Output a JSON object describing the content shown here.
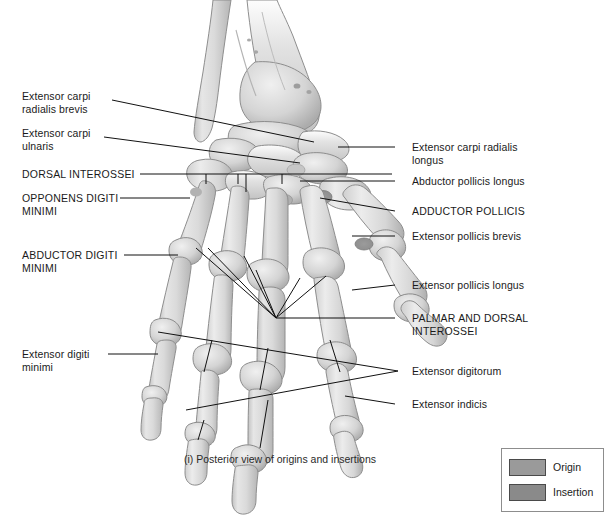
{
  "figure": {
    "caption": "(i) Posterior view of origins and insertions",
    "background_color": "#ffffff",
    "line_color": "#111111",
    "bone_fill": "#dcdcdc",
    "bone_shade": "#b9b9b9",
    "bone_outline": "#8e8e8e"
  },
  "labels_left": [
    {
      "id": "extensor-carpi-radialis-brevis",
      "text": "Extensor carpi\nradialis brevis",
      "style": "title",
      "x": 22,
      "y": 95
    },
    {
      "id": "extensor-carpi-ulnaris",
      "text": "Extensor carpi\nulnaris",
      "style": "title",
      "x": 22,
      "y": 132
    },
    {
      "id": "dorsal-interossei",
      "text": "DORSAL INTEROSSEI",
      "style": "caps",
      "x": 22,
      "y": 169
    },
    {
      "id": "opponens-digiti-minimi",
      "text": "OPPONENS DIGITI\nMINIMI",
      "style": "caps",
      "x": 22,
      "y": 194
    },
    {
      "id": "abductor-digiti-minimi",
      "text": "ABDUCTOR DIGITI\nMINIMI",
      "style": "caps",
      "x": 22,
      "y": 251
    },
    {
      "id": "extensor-digiti-minimi",
      "text": "Extensor digiti\nminimi",
      "style": "title",
      "x": 22,
      "y": 349
    }
  ],
  "labels_right": [
    {
      "id": "extensor-carpi-radialis-longus",
      "text": "Extensor carpi radialis\nlongus",
      "style": "title",
      "x": 412,
      "y": 142
    },
    {
      "id": "abductor-pollicis-longus",
      "text": "Abductor pollicis longus",
      "style": "title",
      "x": 412,
      "y": 177
    },
    {
      "id": "adductor-pollicis",
      "text": "ADDUCTOR POLLICIS",
      "style": "caps",
      "x": 412,
      "y": 206
    },
    {
      "id": "extensor-pollicis-brevis",
      "text": "Extensor pollicis brevis",
      "style": "title",
      "x": 412,
      "y": 231
    },
    {
      "id": "extensor-pollicis-longus",
      "text": "Extensor pollicis longus",
      "style": "title",
      "x": 412,
      "y": 280
    },
    {
      "id": "palmar-and-dorsal-interossei",
      "text": "PALMAR AND DORSAL\nINTEROSSEI",
      "style": "caps",
      "x": 412,
      "y": 313
    },
    {
      "id": "extensor-digitorum",
      "text": "Extensor digitorum",
      "style": "title",
      "x": 412,
      "y": 366
    },
    {
      "id": "extensor-indicis",
      "text": "Extensor indicis",
      "style": "title",
      "x": 412,
      "y": 399
    }
  ],
  "legend": {
    "items": [
      {
        "id": "origin",
        "label": "Origin",
        "color": "#9a9a9a"
      },
      {
        "id": "insertion",
        "label": "Insertion",
        "color": "#8a8a8a"
      }
    ]
  }
}
